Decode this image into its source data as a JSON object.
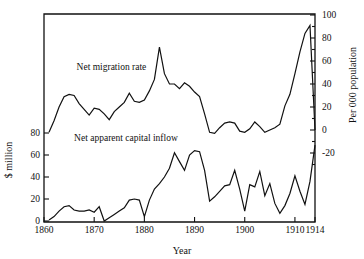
{
  "chart_data": {
    "type": "line",
    "title": "",
    "xlabel": "Year",
    "ylabel_left": "$ million",
    "ylabel_right": "Per 000 population",
    "xlim": [
      1860,
      1914
    ],
    "ylim_left": [
      0,
      95
    ],
    "ylim_right": [
      -30,
      100
    ],
    "grid": false,
    "legend_position": "inline-annotations",
    "x_ticks": [
      "1860",
      "1870",
      "1880",
      "1890",
      "1900",
      "1910",
      "1914"
    ],
    "x_tick_values": [
      1860,
      1870,
      1880,
      1890,
      1900,
      1910,
      1914
    ],
    "y_ticks_left": [
      "0",
      "20",
      "40",
      "60",
      "80"
    ],
    "y_tick_values_left": [
      0,
      20,
      40,
      60,
      80
    ],
    "y_ticks_right": [
      "-20",
      "0",
      "20",
      "40",
      "60",
      "80",
      "100"
    ],
    "y_tick_values_right": [
      -20,
      0,
      20,
      40,
      60,
      80,
      100
    ],
    "annotations": [
      {
        "text": "Net migration rate",
        "x": 1866.5,
        "y_right": 52
      },
      {
        "text": "Net apparent capital inflow",
        "x": 1866.0,
        "y_left": 73
      }
    ],
    "series": [
      {
        "name": "Net migration rate",
        "axis": "right",
        "units": "per 000 population",
        "x": [
          1861,
          1862,
          1863,
          1864,
          1865,
          1866,
          1867,
          1868,
          1869,
          1870,
          1871,
          1872,
          1873,
          1874,
          1875,
          1876,
          1877,
          1878,
          1879,
          1880,
          1881,
          1882,
          1883,
          1884,
          1885,
          1886,
          1887,
          1888,
          1889,
          1890,
          1891,
          1892,
          1893,
          1894,
          1895,
          1896,
          1897,
          1898,
          1899,
          1900,
          1901,
          1902,
          1903,
          1904,
          1905,
          1906,
          1907,
          1908,
          1909,
          1910,
          1911,
          1912,
          1913,
          1914
        ],
        "values": [
          -2,
          8,
          20,
          29,
          31,
          30,
          23,
          18,
          13,
          19,
          18,
          14,
          9,
          16,
          20,
          24,
          32,
          25,
          24,
          26,
          34,
          44,
          72,
          49,
          40,
          40,
          36,
          41,
          38,
          33,
          29,
          14,
          -2,
          -3,
          2,
          6,
          7,
          6,
          -1,
          -2,
          1,
          7,
          3,
          -2,
          0,
          2,
          5,
          21,
          31,
          49,
          68,
          84,
          91,
          0
        ]
      },
      {
        "name": "Net apparent capital inflow",
        "axis": "left",
        "units": "$ million",
        "x": [
          1861,
          1862,
          1863,
          1864,
          1865,
          1866,
          1867,
          1868,
          1869,
          1870,
          1871,
          1872,
          1873,
          1874,
          1875,
          1876,
          1877,
          1878,
          1879,
          1880,
          1881,
          1882,
          1883,
          1884,
          1885,
          1886,
          1887,
          1888,
          1889,
          1890,
          1891,
          1892,
          1893,
          1894,
          1895,
          1896,
          1897,
          1898,
          1899,
          1900,
          1901,
          1902,
          1903,
          1904,
          1905,
          1906,
          1907,
          1908,
          1909,
          1910,
          1911,
          1912,
          1913,
          1914
        ],
        "values": [
          1,
          4,
          9,
          13,
          14,
          10,
          9,
          9,
          10,
          8,
          13,
          0,
          3,
          6,
          9,
          12,
          19,
          20,
          19,
          4,
          19,
          29,
          34,
          40,
          48,
          62,
          54,
          46,
          60,
          64,
          63,
          46,
          18,
          22,
          27,
          32,
          33,
          46,
          29,
          9,
          33,
          31,
          45,
          23,
          34,
          16,
          7,
          14,
          25,
          41,
          27,
          15,
          36,
          69
        ]
      }
    ]
  },
  "axes": {
    "x_title": "Year",
    "y_left_title": "$ million",
    "y_right_title": "Per 000 population"
  }
}
